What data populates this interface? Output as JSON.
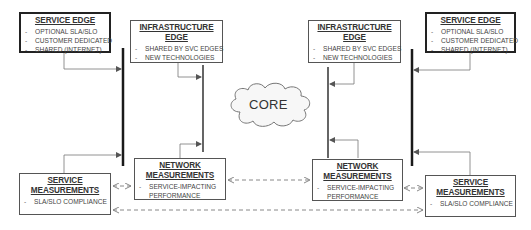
{
  "diagram": {
    "core": {
      "label": "CORE"
    },
    "left": {
      "service_edge": {
        "title": "SERVICE EDGE",
        "items": [
          "OPTIONAL SLA/SLO",
          "CUSTOMER DEDICATED",
          "SHARED (INTERNET)"
        ]
      },
      "infrastructure_edge": {
        "title_line1": "INFRASTRUCTURE",
        "title_line2": "EDGE",
        "items": [
          "SHARED BY SVC EDGES",
          "NEW TECHNOLOGIES"
        ]
      },
      "network_measurements": {
        "title_line1": "NETWORK",
        "title_line2": "MEASUREMENTS",
        "items": [
          "SERVICE-IMPACTING",
          "PERFORMANCE"
        ]
      },
      "service_measurements": {
        "title_line1": "SERVICE",
        "title_line2": "MEASUREMENTS",
        "items": [
          "SLA/SLO COMPLIANCE"
        ]
      }
    },
    "right": {
      "service_edge": {
        "title": "SERVICE EDGE",
        "items": [
          "OPTIONAL SLA/SLO",
          "CUSTOMER DEDICATED",
          "SHARED (INTERNET)"
        ]
      },
      "infrastructure_edge": {
        "title_line1": "INFRASTRUCTURE",
        "title_line2": "EDGE",
        "items": [
          "SHARED BY SVC EDGES",
          "NEW TECHNOLOGIES"
        ]
      },
      "network_measurements": {
        "title_line1": "NETWORK",
        "title_line2": "MEASUREMENTS",
        "items": [
          "SERVICE-IMPACTING",
          "PERFORMANCE"
        ]
      },
      "service_measurements": {
        "title_line1": "SERVICE",
        "title_line2": "MEASUREMENTS",
        "items": [
          "SLA/SLO COMPLIANCE"
        ]
      }
    },
    "colors": {
      "service_bar": "#1a1a1a",
      "infra_bar": "#555555",
      "connector": "#777777",
      "dashed": "#888888"
    }
  }
}
